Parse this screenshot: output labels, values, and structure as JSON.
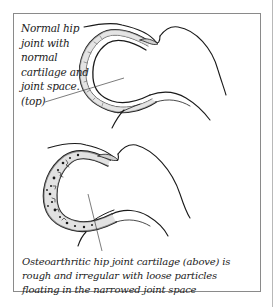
{
  "figure": {
    "top_label": {
      "lines": [
        "Normal hip",
        "joint with",
        "normal",
        "cartilage and",
        "joint space.",
        "(top)"
      ]
    },
    "bottom_label": {
      "lines": [
        "Osteoarthritic hip joint cartilage (above) is",
        "rough and irregular with loose particles",
        "floating in the narrowed joint space"
      ]
    },
    "panels": [
      {
        "name": "normal-hip-joint",
        "description": "Normal hip joint with smooth cartilage and even joint space"
      },
      {
        "name": "osteoarthritic-hip-joint",
        "description": "Osteoarthritic hip joint with rough cartilage and loose particles"
      }
    ],
    "colors": {
      "line": "#1a1a1a",
      "cartilage_fill": "#d9d9d9",
      "frame": "#8a8a8a"
    }
  }
}
